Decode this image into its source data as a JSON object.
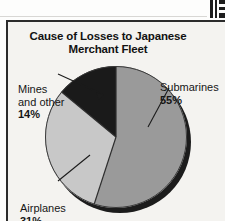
{
  "page": {
    "background_color": "#f4f3f0",
    "frame_color": "#2b2b2b"
  },
  "chart_title": {
    "line1": "Cause of Losses to Japanese",
    "line2": "Merchant Fleet"
  },
  "labels": {
    "submarines": {
      "name": "Submarines",
      "pct": "55%"
    },
    "airplanes": {
      "name": "Airplanes",
      "pct": "31%"
    },
    "mines": {
      "name_line1": "Mines",
      "name_line2": "and other",
      "pct": "14%"
    }
  },
  "chart_data": {
    "type": "pie",
    "title": "Cause of Losses to Japanese Merchant Fleet",
    "categories": [
      "Submarines",
      "Airplanes",
      "Mines and other"
    ],
    "values": [
      55,
      31,
      14
    ],
    "value_labels": [
      "55%",
      "31%",
      "14%"
    ],
    "colors": [
      "#9a9a9a",
      "#c8c8c8",
      "#1a1a1a"
    ],
    "units": "percent",
    "total": 100,
    "start_angle_deg": 0,
    "direction": "clockwise",
    "legend": "none",
    "labels_placement": "outside-with-leader-lines",
    "grid": false,
    "style": "3d-drop-shadow"
  }
}
